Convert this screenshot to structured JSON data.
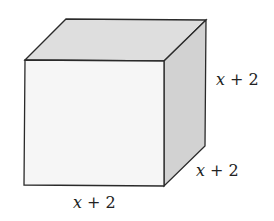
{
  "diagram": {
    "type": "cube",
    "labels": {
      "height": "x + 2",
      "depth": "x + 2",
      "width": "x + 2"
    },
    "colors": {
      "front": "#f6f6f6",
      "top": "#dedede",
      "side": "#d2d2d2",
      "edge": "#2a2a2a"
    }
  }
}
